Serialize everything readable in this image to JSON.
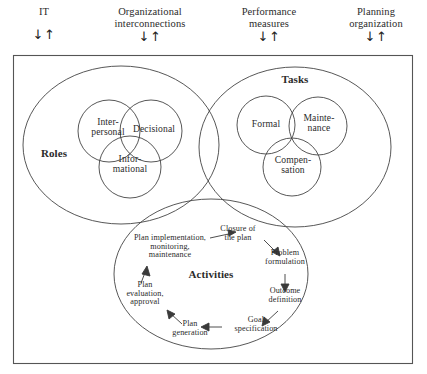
{
  "figure": {
    "title": "",
    "type": "venn-diagram",
    "border_color": "#555555",
    "circle_color": "#444444",
    "text_color": "#2b2b2b"
  },
  "header": {
    "inputs": [
      {
        "label": "IT",
        "arrows": "↓↑"
      },
      {
        "label": "Organizational\ninterconnections",
        "arrows": "↓↑"
      },
      {
        "label": "Performance\nmeasures",
        "arrows": "↓↑"
      },
      {
        "label": "Planning\norganization",
        "arrows": "↓↑"
      }
    ]
  },
  "groups": {
    "roles": {
      "label": "Roles",
      "members": [
        {
          "label": "Inter-\npersonal"
        },
        {
          "label": "Decisional"
        },
        {
          "label": "Infor-\nmational"
        }
      ]
    },
    "tasks": {
      "label": "Tasks",
      "members": [
        {
          "label": "Formal"
        },
        {
          "label": "Mainte-\nnance"
        },
        {
          "label": "Compen-\nsation"
        }
      ]
    },
    "activities": {
      "label": "Activities",
      "steps": [
        {
          "label": "Closure of\nthe plan"
        },
        {
          "label": "Problem\nformulation"
        },
        {
          "label": "Outcome\ndefinition"
        },
        {
          "label": "Goal\nspecification"
        },
        {
          "label": "Plan\ngeneration"
        },
        {
          "label": "Plan\nevaluation,\napproval"
        },
        {
          "label": "Plan implementation,\nmonitoring,\nmaintenance"
        }
      ]
    }
  }
}
